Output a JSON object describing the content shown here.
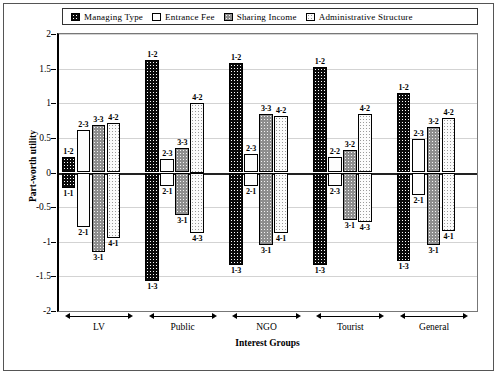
{
  "chart_data": {
    "type": "bar",
    "title": "",
    "xlabel": "Interest Groups",
    "ylabel": "Part-worth utility",
    "ylim": [
      -2,
      2
    ],
    "yticks": [
      2,
      1.5,
      1,
      0.5,
      0,
      -0.5,
      -1,
      -1.5,
      -2
    ],
    "ytick_labels": [
      "2",
      "1.5",
      "1",
      "0.5",
      "0",
      "-0.5",
      "-1",
      "-1.5",
      "-2"
    ],
    "grid": true,
    "legend_position": "top",
    "categories": [
      "LV",
      "Public",
      "NGO",
      "Tourist",
      "General"
    ],
    "series": [
      {
        "name": "Managing Type",
        "pattern": "black-dotted",
        "color": "#0a0a0a",
        "positive": [
          0.22,
          1.63,
          1.58,
          1.52,
          1.15
        ],
        "negative": [
          -0.22,
          -1.57,
          -1.33,
          -1.33,
          -1.28
        ],
        "positive_labels": [
          "1-2",
          "1-2",
          "1-2",
          "1-2",
          "1-2"
        ],
        "negative_labels": [
          "1-1",
          "1-3",
          "1-3",
          "1-3",
          "1-3"
        ]
      },
      {
        "name": "Entrance Fee",
        "pattern": "white-sparse-dotted",
        "color": "#fdfdfd",
        "positive": [
          0.62,
          0.2,
          0.27,
          0.22,
          0.48
        ],
        "negative": [
          -0.78,
          -0.2,
          -0.2,
          -0.2,
          -0.33
        ],
        "positive_labels": [
          "2-3",
          "2-3",
          "2-3",
          "2-2",
          "2-3"
        ],
        "negative_labels": [
          "2-1",
          "2-1",
          "2-1",
          "2-3",
          "2-1"
        ]
      },
      {
        "name": "Sharing Income",
        "pattern": "gray-dotted",
        "color": "#8e8e8e",
        "positive": [
          0.68,
          0.35,
          0.84,
          0.32,
          0.65
        ],
        "negative": [
          -1.15,
          -0.62,
          -1.05,
          -0.68,
          -1.05
        ],
        "positive_labels": [
          "3-3",
          "3-3",
          "3-3",
          "3-2",
          "3-2"
        ],
        "negative_labels": [
          "3-1",
          "3-1",
          "3-1",
          "3-1",
          "3-1"
        ]
      },
      {
        "name": "Administrative Structure",
        "pattern": "light-dotted",
        "color": "#fbfbfb",
        "positive": [
          0.72,
          1.0,
          0.82,
          0.85,
          0.78
        ],
        "negative": [
          -0.95,
          -0.88,
          -0.87,
          -0.72,
          -0.85
        ],
        "positive_labels": [
          "4-2",
          "4-2",
          "4-2",
          "4-2",
          "4-2"
        ],
        "negative_labels": [
          "4-1",
          "4-3",
          "4-1",
          "4-3",
          "4-1"
        ]
      }
    ]
  },
  "legend": {
    "items": [
      {
        "label": "Managing Type"
      },
      {
        "label": "Entrance Fee"
      },
      {
        "label": "Sharing Income"
      },
      {
        "label": "Administrative Structure"
      }
    ]
  }
}
